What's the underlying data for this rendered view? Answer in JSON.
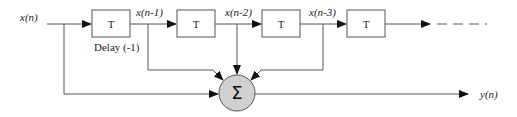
{
  "diagram": {
    "input_label": "x(n)",
    "output_label": "y(n)",
    "delay_caption": "Delay (-1)",
    "delay_blocks": [
      {
        "label": "T"
      },
      {
        "label": "T"
      },
      {
        "label": "T"
      },
      {
        "label": "T"
      }
    ],
    "tap_labels": [
      "x(n-1)",
      "x(n-2)",
      "x(n-3)"
    ],
    "summer_symbol": "Σ",
    "colors": {
      "stroke": "#555555",
      "summer_fill": "#d0d0d0",
      "text": "#222222"
    }
  }
}
